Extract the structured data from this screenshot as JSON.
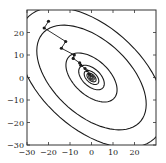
{
  "chart_data": {
    "type": "line",
    "title": "",
    "xlabel": "",
    "ylabel": "",
    "xlim": [
      -30,
      30
    ],
    "ylim": [
      -30,
      30
    ],
    "grid": false,
    "x_ticks": [
      -30,
      -20,
      -10,
      0,
      10,
      20
    ],
    "y_ticks": [
      -30,
      -20,
      -10,
      0,
      10,
      20
    ],
    "x_tick_labels": [
      "−30",
      "−20",
      "−10",
      "0",
      "10",
      "20"
    ],
    "y_tick_labels": [
      "−30",
      "−20",
      "−10",
      "0",
      "10",
      "20"
    ],
    "contours": {
      "description": "elliptical level sets of a quadratic, rotated ~-45 degrees, centered at origin",
      "center": [
        0,
        0
      ],
      "angle_deg": -40,
      "semi_axes": [
        [
          40,
          23
        ],
        [
          30,
          17
        ],
        [
          14,
          8
        ],
        [
          7,
          4
        ],
        [
          4,
          2.3
        ],
        [
          2.5,
          1.4
        ],
        [
          1.5,
          0.9
        ],
        [
          0.8,
          0.5
        ]
      ]
    },
    "series": [
      {
        "name": "optimization path",
        "marker": "circle",
        "x": [
          -20,
          -22,
          -12,
          -14,
          -8,
          -8.5,
          -5.5,
          -5,
          -3,
          -2,
          -1,
          0
        ],
        "y": [
          25,
          22,
          16,
          13,
          10,
          8.5,
          6.5,
          5.5,
          4,
          3,
          1.5,
          0
        ]
      }
    ],
    "colors": {
      "line": "#1a1a1a",
      "axes": "#333333"
    }
  }
}
